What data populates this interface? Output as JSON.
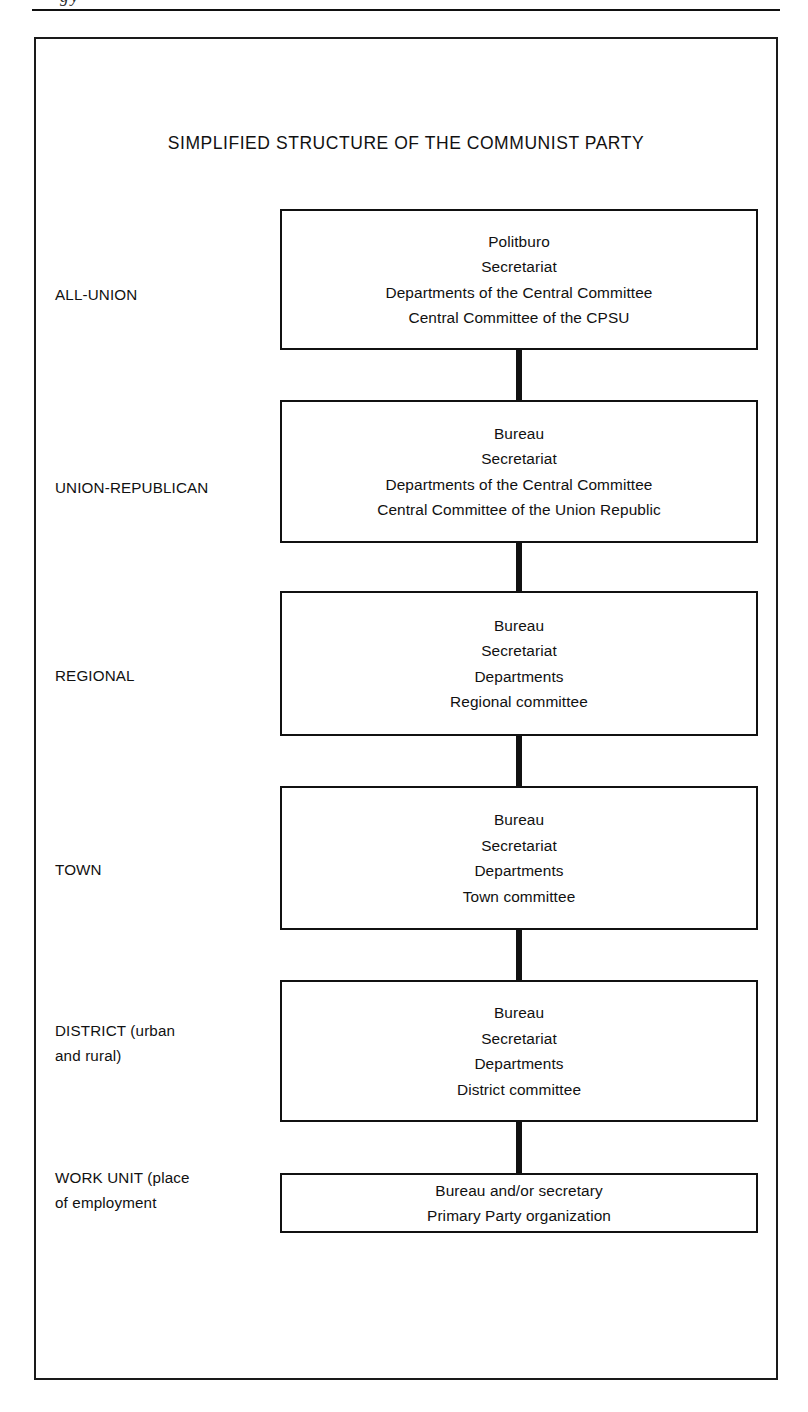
{
  "page": {
    "background_color": "#ffffff",
    "ink_color": "#111111",
    "top_artifact_text": "gy"
  },
  "diagram": {
    "title": "SIMPLIFIED STRUCTURE OF THE COMMUNIST PARTY",
    "type": "hierarchy-chain",
    "rows": [
      {
        "label_lines": [
          "ALL-UNION"
        ],
        "box_lines": [
          "Politburo",
          "Secretariat",
          "Departments of the Central Committee",
          "Central Committee of the CPSU"
        ]
      },
      {
        "label_lines": [
          "UNION-REPUBLICAN"
        ],
        "box_lines": [
          "Bureau",
          "Secretariat",
          "Departments of the Central Committee",
          "Central Committee of the Union Republic"
        ]
      },
      {
        "label_lines": [
          "REGIONAL"
        ],
        "box_lines": [
          "Bureau",
          "Secretariat",
          "Departments",
          "Regional committee"
        ]
      },
      {
        "label_lines": [
          "TOWN"
        ],
        "box_lines": [
          "Bureau",
          "Secretariat",
          "Departments",
          "Town committee"
        ]
      },
      {
        "label_lines": [
          "DISTRICT (urban",
          "and rural)"
        ],
        "box_lines": [
          "Bureau",
          "Secretariat",
          "Departments",
          "District committee"
        ]
      },
      {
        "label_lines": [
          "WORK UNIT (place",
          "of employment"
        ],
        "box_lines": [
          "Bureau and/or secretary",
          "Primary Party organization"
        ]
      }
    ]
  }
}
